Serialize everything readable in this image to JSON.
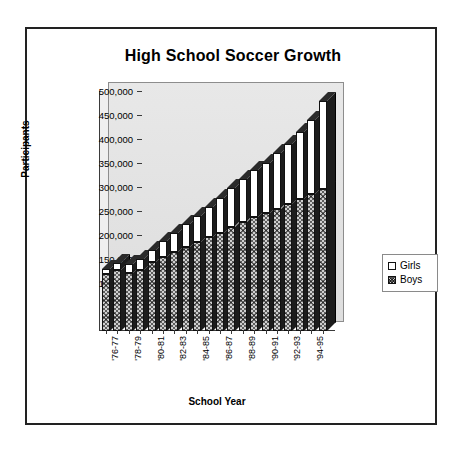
{
  "chart_data": {
    "type": "bar",
    "subtype": "stacked-column-3d",
    "title": "High School Soccer Growth",
    "xlabel": "School Year",
    "ylabel": "Participants",
    "ylim": [
      0,
      500000
    ],
    "ytick_step": 50000,
    "ytick_labels": [
      "500,000",
      "450,000",
      "400,000",
      "350,000",
      "300,000",
      "250,000",
      "200,000",
      "150,000",
      "100,000",
      "50,000"
    ],
    "ytick_values": [
      500000,
      450000,
      400000,
      350000,
      300000,
      250000,
      200000,
      150000,
      100000,
      50000
    ],
    "grid": false,
    "legend_position": "right",
    "categories": [
      "'76-77",
      "'77-78",
      "'78-79",
      "'79-80",
      "'80-81",
      "'81-82",
      "'82-83",
      "'83-84",
      "'84-85",
      "'85-86",
      "'86-87",
      "'87-88",
      "'88-89",
      "'89-90",
      "'90-91",
      "'91-92",
      "'92-93",
      "'93-94",
      "'94-95",
      "'95-96"
    ],
    "xtick_labels_shown": [
      "'76-77",
      "'78-79",
      "'80-81",
      "'82-83",
      "'84-85",
      "'86-87",
      "'88-89",
      "'90-91",
      "'92-93",
      "'94-95"
    ],
    "series": [
      {
        "name": "Boys",
        "swatch": "hatched",
        "color": "#cfcfcf",
        "values": [
          118000,
          128000,
          121000,
          128000,
          143000,
          155000,
          165000,
          175000,
          185000,
          195000,
          205000,
          217000,
          228000,
          238000,
          245000,
          255000,
          265000,
          275000,
          285000,
          295000
        ]
      },
      {
        "name": "Girls",
        "swatch": "white",
        "color": "#ffffff",
        "values": [
          12000,
          14000,
          18000,
          22000,
          26000,
          33000,
          40000,
          48000,
          55000,
          63000,
          72000,
          80000,
          88000,
          97000,
          105000,
          115000,
          125000,
          140000,
          155000,
          185000
        ]
      }
    ],
    "totals": [
      130000,
      142000,
      139000,
      150000,
      169000,
      188000,
      205000,
      223000,
      240000,
      258000,
      277000,
      297000,
      316000,
      335000,
      350000,
      370000,
      390000,
      415000,
      440000,
      480000
    ]
  },
  "legend": {
    "items": [
      {
        "label": "Girls"
      },
      {
        "label": "Boys"
      }
    ]
  },
  "colors": {
    "frame": "#222222",
    "wall": "#e4e4e4",
    "bar_side": "#1c1c1c",
    "axis": "#3a3a3a"
  }
}
